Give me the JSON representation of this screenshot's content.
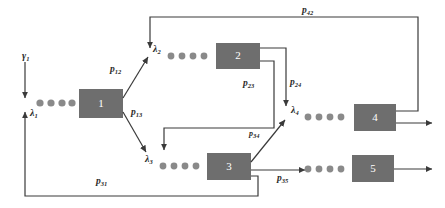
{
  "diagram": {
    "type": "open-queueing-network",
    "title": "",
    "background_color": "#ffffff",
    "node_fill_color": "#6e6e6e",
    "line_color": "#3a3a3a",
    "customer_color": "#8a8a8a",
    "nodes": [
      {
        "id": "1",
        "label": "1",
        "x": 79,
        "y": 89,
        "w": 44,
        "h": 29
      },
      {
        "id": "2",
        "label": "2",
        "x": 216,
        "y": 43,
        "w": 44,
        "h": 26
      },
      {
        "id": "3",
        "label": "3",
        "x": 207,
        "y": 153,
        "w": 44,
        "h": 27
      },
      {
        "id": "4",
        "label": "4",
        "x": 354,
        "y": 104,
        "w": 42,
        "h": 27
      },
      {
        "id": "5",
        "label": "5",
        "x": 352,
        "y": 155,
        "w": 42,
        "h": 27
      }
    ],
    "queues": [
      {
        "id": "queue-1",
        "arrival_label": "λ",
        "arrival_sub": "1",
        "customers": 4
      },
      {
        "id": "queue-2",
        "arrival_label": "λ",
        "arrival_sub": "2",
        "customers": 4
      },
      {
        "id": "queue-3",
        "arrival_label": "λ",
        "arrival_sub": "3",
        "customers": 4
      },
      {
        "id": "queue-4",
        "arrival_label": "λ",
        "arrival_sub": "4",
        "customers": 4
      },
      {
        "id": "queue-5",
        "arrival_label": "",
        "arrival_sub": "",
        "customers": 4
      }
    ],
    "labels": {
      "gamma_1": {
        "base": "γ",
        "sub": "1",
        "x": 22,
        "y": 56
      },
      "lambda_1": {
        "base": "λ",
        "sub": "1",
        "x": 30,
        "y": 113
      },
      "lambda_2": {
        "base": "λ",
        "sub": "2",
        "x": 152,
        "y": 48
      },
      "lambda_3": {
        "base": "λ",
        "sub": "3",
        "x": 147,
        "y": 158
      },
      "lambda_4": {
        "base": "λ",
        "sub": "4",
        "x": 289,
        "y": 111
      },
      "p_12": {
        "base": "p",
        "sub": "12",
        "x": 110,
        "y": 70
      },
      "p_13": {
        "base": "p",
        "sub": "13",
        "x": 131,
        "y": 113
      },
      "p_23": {
        "base": "p",
        "sub": "23",
        "x": 243,
        "y": 84
      },
      "p_24": {
        "base": "p",
        "sub": "24",
        "x": 290,
        "y": 83
      },
      "p_34": {
        "base": "p",
        "sub": "34",
        "x": 249,
        "y": 135
      },
      "p_35": {
        "base": "p",
        "sub": "35",
        "x": 277,
        "y": 172
      },
      "p_42": {
        "base": "p",
        "sub": "42",
        "x": 302,
        "y": 9
      },
      "p_31": {
        "base": "p",
        "sub": "31",
        "x": 96,
        "y": 181
      }
    },
    "flows": [
      {
        "id": "external-arrival",
        "from": "outside",
        "to": "queue-1",
        "label": "γ₁"
      },
      {
        "id": "flow-1-2",
        "from": "1",
        "to": "queue-2",
        "label": "p₁₂"
      },
      {
        "id": "flow-1-3",
        "from": "1",
        "to": "queue-3",
        "label": "p₁₃"
      },
      {
        "id": "flow-2-3",
        "from": "2",
        "to": "queue-3",
        "label": "p₂₃"
      },
      {
        "id": "flow-2-4",
        "from": "2",
        "to": "queue-4",
        "label": "p₂₄"
      },
      {
        "id": "flow-3-4",
        "from": "3",
        "to": "queue-4",
        "label": "p₃₄"
      },
      {
        "id": "flow-3-5",
        "from": "3",
        "to": "queue-5",
        "label": "p₃₅"
      },
      {
        "id": "flow-3-1",
        "from": "3",
        "to": "queue-1",
        "label": "p₃₁"
      },
      {
        "id": "flow-4-2",
        "from": "4",
        "to": "queue-2",
        "label": "p₄₂"
      },
      {
        "id": "departure-4",
        "from": "4",
        "to": "outside",
        "label": ""
      },
      {
        "id": "departure-5",
        "from": "5",
        "to": "outside",
        "label": ""
      }
    ]
  }
}
